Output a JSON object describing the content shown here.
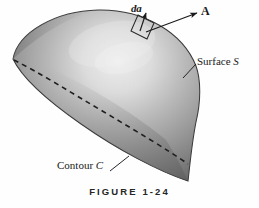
{
  "figure": {
    "caption": "FIGURE 1-24",
    "background_color": "#fefefe",
    "ink_color": "#1a1a1a"
  },
  "labels": {
    "area_element": "da",
    "vector_field": "A",
    "surface_prefix": "Surface ",
    "surface_symbol": "S",
    "contour_prefix": "Contour ",
    "contour_symbol": "C"
  },
  "diagram": {
    "type": "3d-shaded-surface",
    "surface_shape": "hemispherical-dome",
    "surface_colors": {
      "highlight": "#e8e8e8",
      "midtone": "#9c9c9c",
      "shadow": "#5a5a5a",
      "outline": "#3c3c3c"
    },
    "dome_bounds": {
      "left": 13,
      "top": 10,
      "right": 201,
      "bottom": 181
    },
    "contour_style": "dashed",
    "contour_color": "#1f1f1f",
    "area_patch": {
      "shape": "parallelogram",
      "fill": "none",
      "stroke": "#262626",
      "center_x": 142,
      "center_y": 27
    },
    "normal_arrow": {
      "x1": 141,
      "y1": 30,
      "x2": 146,
      "y2": 13
    },
    "field_arrow": {
      "x1": 147,
      "y1": 31,
      "x2": 197,
      "y2": 13
    },
    "surface_leader": {
      "x1": 183,
      "y1": 78,
      "x2": 196,
      "y2": 64
    },
    "contour_leader": {
      "x1": 110,
      "y1": 171,
      "x2": 129,
      "y2": 156
    }
  }
}
